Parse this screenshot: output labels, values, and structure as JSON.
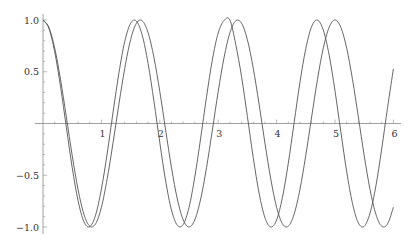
{
  "chart_data": {
    "type": "line",
    "title": "",
    "xlabel": "",
    "ylabel": "",
    "xlim": [
      0,
      6
    ],
    "ylim": [
      -1.0,
      1.0
    ],
    "grid": false,
    "legend": null,
    "x_ticks": [
      {
        "value": 1,
        "label": "1"
      },
      {
        "value": 2,
        "label": "2"
      },
      {
        "value": 3,
        "label": "3"
      },
      {
        "value": 4,
        "label": "4"
      },
      {
        "value": 5,
        "label": "5"
      },
      {
        "value": 6,
        "label": "6"
      }
    ],
    "y_ticks": [
      {
        "value": 1.0,
        "label": "1.0"
      },
      {
        "value": 0.5,
        "label": "0.5"
      },
      {
        "value": -0.5,
        "label": "−0.5"
      },
      {
        "value": -1.0,
        "label": "−1.0"
      }
    ],
    "x": [
      0,
      0.1,
      0.2,
      0.3,
      0.4,
      0.5,
      0.6,
      0.7,
      0.8,
      0.9,
      1.0,
      1.1,
      1.2,
      1.3,
      1.4,
      1.5,
      1.6,
      1.7,
      1.8,
      1.9,
      2.0,
      2.1,
      2.2,
      2.3,
      2.4,
      2.5,
      2.6,
      2.7,
      2.8,
      2.9,
      3.0,
      3.1,
      3.2,
      3.3,
      3.4,
      3.5,
      3.6,
      3.7,
      3.8,
      3.9,
      4.0,
      4.1,
      4.2,
      4.3,
      4.4,
      4.5,
      4.6,
      4.7,
      4.8,
      4.9,
      5.0,
      5.1,
      5.2,
      5.3,
      5.4,
      5.5,
      5.6,
      5.7,
      5.8,
      5.9,
      6.0
    ],
    "series": [
      {
        "name": "curve-a",
        "color": "#555555",
        "values": [
          1.0,
          0.92,
          0.694,
          0.357,
          -0.037,
          -0.426,
          -0.745,
          -0.948,
          -0.997,
          -0.886,
          -0.634,
          -0.286,
          0.111,
          0.489,
          0.793,
          0.968,
          0.989,
          0.851,
          0.578,
          0.214,
          -0.185,
          -0.555,
          -0.836,
          -0.983,
          -0.976,
          -0.811,
          -0.514,
          -0.141,
          0.258,
          0.615,
          0.875,
          0.995,
          1.0,
          0.765,
          0.452,
          0.067,
          -0.329,
          -0.672,
          -0.909,
          -1.0,
          -0.932,
          -0.714,
          -0.385,
          0.008,
          0.399,
          0.724,
          0.937,
          0.999,
          0.902,
          0.661,
          0.315,
          -0.081,
          -0.465,
          -0.774,
          -0.961,
          -0.993,
          -0.865,
          -0.604,
          -0.244,
          0.154,
          0.528
        ]
      },
      {
        "name": "curve-b",
        "color": "#555555",
        "values": [
          1.0,
          0.93,
          0.729,
          0.426,
          0.063,
          -0.309,
          -0.637,
          -0.876,
          -0.992,
          -0.97,
          -0.81,
          -0.531,
          -0.184,
          0.188,
          0.533,
          0.81,
          0.969,
          0.992,
          0.876,
          0.637,
          0.309,
          -0.063,
          -0.427,
          -0.729,
          -0.93,
          -1.0,
          -0.93,
          -0.729,
          -0.427,
          -0.063,
          0.309,
          0.637,
          0.876,
          0.992,
          0.969,
          0.809,
          0.535,
          0.187,
          -0.188,
          -0.536,
          -0.809,
          -0.969,
          -0.992,
          -0.876,
          -0.636,
          -0.308,
          0.063,
          0.427,
          0.73,
          0.93,
          1.0,
          0.929,
          0.728,
          0.425,
          0.062,
          -0.31,
          -0.638,
          -0.877,
          -0.992,
          -0.97,
          -0.809
        ]
      }
    ]
  }
}
